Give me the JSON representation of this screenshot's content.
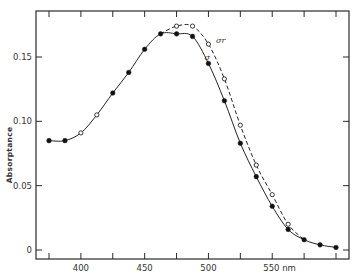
{
  "chart_data": {
    "type": "line",
    "title": "",
    "xlabel": "nm",
    "ylabel": "Absorptance",
    "xlim": [
      375,
      600
    ],
    "ylim": [
      0,
      0.18
    ],
    "grid": false,
    "legend": "inline labels",
    "x_ticks": [
      375,
      400,
      425,
      450,
      475,
      500,
      525,
      550,
      575,
      600
    ],
    "x_tick_labels": [
      {
        "value": 400,
        "label": "400"
      },
      {
        "value": 450,
        "label": "450"
      },
      {
        "value": 500,
        "label": "500"
      },
      {
        "value": 550,
        "label": "550 nm"
      }
    ],
    "y_ticks": [
      0,
      0.05,
      0.1,
      0.15
    ],
    "y_tick_labels": [
      {
        "value": 0,
        "label": "0"
      },
      {
        "value": 0.05,
        "label": "0.05"
      },
      {
        "value": 0.1,
        "label": "0.10"
      },
      {
        "value": 0.15,
        "label": "0.15"
      }
    ],
    "series": [
      {
        "name": "σ",
        "marker": "filled",
        "line": "solid",
        "label_pos": {
          "x": 497,
          "y": 0.148
        },
        "x": [
          375,
          387.5,
          400,
          412.5,
          425,
          437.5,
          450,
          462.5,
          475,
          487.5,
          500,
          512.5,
          525,
          537.5,
          550,
          562.5,
          575,
          587.5,
          600
        ],
        "values": [
          0.085,
          0.085,
          0.091,
          0.105,
          0.122,
          0.138,
          0.156,
          0.168,
          0.168,
          0.166,
          0.145,
          0.116,
          0.083,
          0.057,
          0.034,
          0.016,
          0.008,
          0.004,
          0.002
        ],
        "open_marker_x": [
          400,
          412.5
        ]
      },
      {
        "name": "σr",
        "marker": "open",
        "line": "dashed",
        "label_pos": {
          "x": 506,
          "y": 0.161
        },
        "x": [
          462.5,
          475,
          487.5,
          500,
          512.5,
          525,
          537.5,
          550,
          562.5,
          575
        ],
        "values": [
          0.168,
          0.174,
          0.174,
          0.16,
          0.133,
          0.097,
          0.066,
          0.043,
          0.02,
          0.008
        ],
        "marker_x": [
          475,
          487.5,
          500,
          512.5,
          525,
          537.5,
          550,
          562.5
        ]
      }
    ]
  },
  "layout": {
    "frame": {
      "left": 36,
      "top": 11,
      "right": 349,
      "bottom": 259
    },
    "x_px": {
      "min_val": 375,
      "min_px": 49,
      "max_val": 600,
      "max_px": 336
    },
    "y_px": {
      "zero_px": 250,
      "per_unit": 1286.7
    }
  }
}
